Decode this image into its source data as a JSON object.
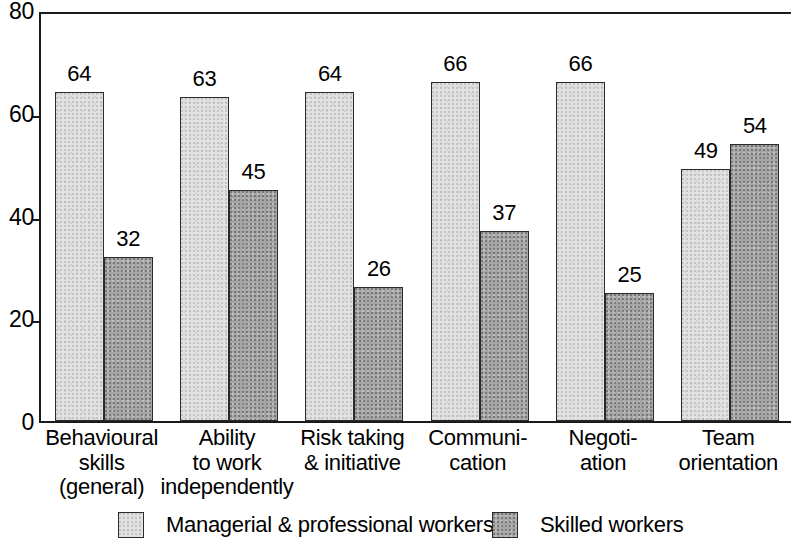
{
  "chart_data": {
    "type": "bar",
    "title": "",
    "subtitle": "",
    "xlabel": "",
    "ylabel": "",
    "ylim": [
      0,
      80
    ],
    "yticks": [
      0,
      20,
      40,
      60,
      80
    ],
    "ytick_labels": [
      "0",
      "20",
      "40",
      "60",
      "80"
    ],
    "grid": false,
    "legend_position": "bottom",
    "categories": [
      "Behavioural skills (general)",
      "Ability to work independently",
      "Risk taking & initiative",
      "Communi- cation",
      "Negoti- ation",
      "Team orientation"
    ],
    "category_lines": [
      [
        "Behavioural",
        "skills",
        "(general)"
      ],
      [
        "Ability",
        "to work",
        "independently"
      ],
      [
        "Risk taking",
        "& initiative"
      ],
      [
        "Communi-",
        "cation"
      ],
      [
        "Negoti-",
        "ation"
      ],
      [
        "Team",
        "orientation"
      ]
    ],
    "series": [
      {
        "name": "Managerial & professional workers",
        "color": "#e2e2e2",
        "values": [
          64,
          63,
          64,
          66,
          66,
          49
        ],
        "value_labels": [
          "64",
          "63",
          "64",
          "66",
          "66",
          "49"
        ]
      },
      {
        "name": "Skilled workers",
        "color": "#a6a6a6",
        "values": [
          32,
          45,
          26,
          37,
          25,
          54
        ],
        "value_labels": [
          "32",
          "45",
          "26",
          "37",
          "25",
          "54"
        ]
      }
    ]
  },
  "legend": {
    "items": [
      {
        "label": "Managerial & professional workers",
        "swatch": "light"
      },
      {
        "label": "Skilled workers",
        "swatch": "dark"
      }
    ]
  },
  "colors": {
    "axis": "#1a1a1a",
    "bar_outline": "#2b2b2b",
    "series_light": "#e2e2e2",
    "series_dark": "#a6a6a6",
    "background": "#ffffff"
  }
}
